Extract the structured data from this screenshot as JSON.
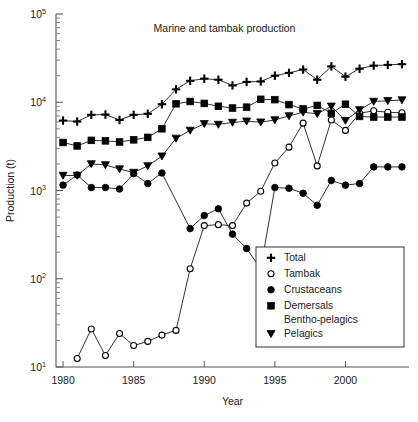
{
  "chart_data": {
    "type": "line",
    "title": "Marine and tambak production",
    "xlabel": "Year",
    "ylabel": "Production (t)",
    "yscale": "log",
    "ylim": [
      10,
      100000
    ],
    "xlim": [
      1979.5,
      2004.5
    ],
    "grid": false,
    "legend_position": "bottom-right",
    "y_tick_labels": [
      "10⁵",
      "10⁴",
      "10³",
      "10²",
      "10¹"
    ],
    "y_tick_values": [
      100000,
      10000,
      1000,
      100,
      10
    ],
    "y_tick_mantissa": [
      "10",
      "10",
      "10",
      "10",
      "10"
    ],
    "y_tick_exponents": [
      "5",
      "4",
      "3",
      "2",
      "1"
    ],
    "x_tick_labels": [
      "1980",
      "1985",
      "1990",
      "1995",
      "2000"
    ],
    "x_tick_values": [
      1980,
      1985,
      1990,
      1995,
      2000
    ],
    "x": [
      1980,
      1981,
      1982,
      1983,
      1984,
      1985,
      1986,
      1987,
      1988,
      1989,
      1990,
      1991,
      1992,
      1993,
      1994,
      1995,
      1996,
      1997,
      1998,
      1999,
      2000,
      2001,
      2002,
      2003,
      2004
    ],
    "series": [
      {
        "name": "Total",
        "marker": "plus",
        "fill": "#000000",
        "values": [
          6200,
          6050,
          7200,
          7250,
          6300,
          7200,
          7400,
          9500,
          14000,
          17500,
          18500,
          18000,
          15500,
          17000,
          17200,
          20000,
          21500,
          23500,
          18000,
          25500,
          19500,
          24000,
          26000,
          26500,
          27000
        ]
      },
      {
        "name": "Tambak",
        "marker": "circle-open",
        "fill": "#ffffff",
        "values": [
          null,
          12.5,
          27,
          13.5,
          24,
          17.5,
          19.5,
          23,
          26,
          130,
          400,
          410,
          400,
          720,
          980,
          2050,
          3100,
          5800,
          1900,
          6300,
          4800,
          7500,
          8000,
          7700,
          7600
        ]
      },
      {
        "name": "Crustaceans",
        "marker": "circle-filled",
        "fill": "#000000",
        "values": [
          1150,
          1500,
          1080,
          1080,
          1040,
          1550,
          1200,
          1580,
          null,
          370,
          520,
          620,
          320,
          220,
          130,
          1080,
          1060,
          930,
          680,
          1300,
          1150,
          1200,
          1850,
          1850,
          1850
        ]
      },
      {
        "name": "Demersals Bentho-pelagics",
        "marker": "square-filled",
        "fill": "#000000",
        "values": [
          3500,
          3200,
          3700,
          3650,
          3550,
          3750,
          4000,
          5000,
          9600,
          10200,
          9700,
          9000,
          8600,
          8800,
          10800,
          10700,
          9400,
          8400,
          9200,
          7500,
          9500,
          6900,
          6800,
          6800,
          6800
        ]
      },
      {
        "name": "Pelagics",
        "marker": "triangle-down",
        "fill": "#000000",
        "values": [
          1480,
          1480,
          2000,
          1950,
          1750,
          1600,
          1900,
          2450,
          3900,
          4800,
          5700,
          5600,
          5900,
          6100,
          5950,
          6300,
          7000,
          7700,
          7400,
          9000,
          6200,
          8200,
          10200,
          10400,
          10600
        ]
      }
    ]
  },
  "legend": {
    "entries": [
      {
        "marker": "plus",
        "label": "Total"
      },
      {
        "marker": "circle-open",
        "label": "Tambak"
      },
      {
        "marker": "circle-filled",
        "label": "Crustaceans"
      },
      {
        "marker": "square-filled",
        "label": "Demersals"
      },
      {
        "marker": "none",
        "label": "Bentho-pelagics"
      },
      {
        "marker": "triangle-down",
        "label": "Pelagics"
      }
    ]
  },
  "colors": {
    "ink": "#000000",
    "axis": "#555555",
    "background": "#ffffff"
  }
}
